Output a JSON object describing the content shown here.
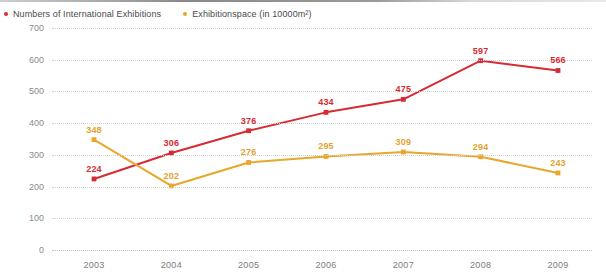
{
  "legend": {
    "items": [
      {
        "label": "Numbers of International Exhibitions",
        "color": "#d42c32",
        "marker": "square-dot-icon"
      },
      {
        "label": "Exhibitionspace (in 10000m²)",
        "color": "#e8a72a",
        "marker": "square-dot-icon"
      }
    ]
  },
  "chart_data": {
    "type": "line",
    "title": "",
    "subtitle": "",
    "xlabel": "",
    "ylabel": "",
    "categories": [
      "2003",
      "2004",
      "2005",
      "2006",
      "2007",
      "2008",
      "2009"
    ],
    "ylim": [
      0,
      700
    ],
    "yticks": [
      0,
      100,
      200,
      300,
      400,
      500,
      600,
      700
    ],
    "grid": true,
    "legend_position": "top-left",
    "series": [
      {
        "name": "Numbers of International Exhibitions",
        "color": "#d42c32",
        "values": [
          224,
          306,
          376,
          434,
          475,
          597,
          566
        ],
        "labels": [
          "224",
          "306",
          "376",
          "434",
          "475",
          "597",
          "566"
        ]
      },
      {
        "name": "Exhibitionspace (in 10000m²)",
        "color": "#e8a72a",
        "values": [
          348,
          202,
          276,
          295,
          309,
          294,
          243
        ],
        "labels": [
          "348",
          "202",
          "276",
          "295",
          "309",
          "294",
          "243"
        ]
      }
    ]
  }
}
